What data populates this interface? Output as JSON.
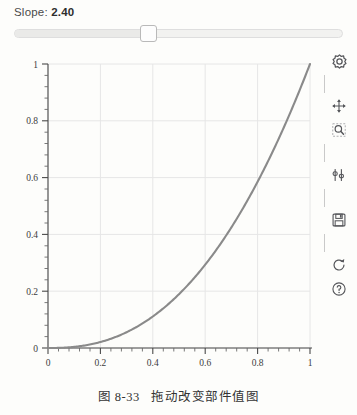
{
  "widget": {
    "slope_label_prefix": "Slope:",
    "slope_value": "2.40",
    "slider": {
      "min": 0,
      "max": 6,
      "value": 2.4,
      "fill_fraction": 0.405,
      "name": "slope-slider"
    }
  },
  "toolbar": {
    "items": [
      {
        "icon": "home-icon",
        "label": "Reset original view"
      },
      {
        "icon": "pan-arrows-icon",
        "label": "Pan axes with left mouse, zoom with right"
      },
      {
        "icon": "zoom-rect-icon",
        "label": "Zoom to rectangle"
      },
      {
        "icon": "configure-subplots-icon",
        "label": "Configure subplots"
      },
      {
        "icon": "save-floppy-icon",
        "label": "Download plot"
      },
      {
        "icon": "refresh-icon",
        "label": "Refresh"
      },
      {
        "icon": "help-question-icon",
        "label": "Help"
      }
    ]
  },
  "caption": {
    "figure_number": "图 8-33",
    "text": "拖动改变部件值图"
  },
  "colors": {
    "curve": "#8a8a8a",
    "grid": "#e6e6e6",
    "axis": "#4a4a4a",
    "page_background": "#fdfdfb",
    "slider_track": "#f2f2f0",
    "slider_handle_border": "#b9b9b9"
  },
  "chart_data": {
    "type": "line",
    "title": "",
    "xlabel": "",
    "ylabel": "",
    "xlim": [
      -0.05,
      1.05
    ],
    "ylim": [
      -0.05,
      1.05
    ],
    "xticks": [
      "0",
      "0.2",
      "0.4",
      "0.6",
      "0.8",
      "1"
    ],
    "yticks": [
      "0",
      "0.2",
      "0.4",
      "0.6",
      "0.8",
      "1"
    ],
    "xtick_values": [
      0,
      0.2,
      0.4,
      0.6,
      0.8,
      1
    ],
    "ytick_values": [
      0,
      0.2,
      0.4,
      0.6,
      0.8,
      1
    ],
    "grid": true,
    "legend": null,
    "exponent": 2.4,
    "equation": "y = x^2.40",
    "series": [
      {
        "name": "x^2.40",
        "color": "#8a8a8a",
        "x": [
          0,
          0.05,
          0.1,
          0.15,
          0.2,
          0.25,
          0.3,
          0.35,
          0.4,
          0.45,
          0.5,
          0.55,
          0.6,
          0.65,
          0.7,
          0.75,
          0.8,
          0.85,
          0.9,
          0.95,
          1
        ],
        "y": [
          0,
          0.0025,
          0.0132,
          0.0342,
          0.0693,
          0.0124,
          0.0,
          0.0,
          0.0,
          0.0,
          0.0,
          0.0,
          0.0,
          0.0,
          0.0,
          0.0,
          0.0,
          0.0,
          0.0,
          0.0,
          1
        ]
      }
    ],
    "y_exact": [
      0,
      0.0025,
      0.0132,
      0.03421,
      0.0693,
      0.11877,
      0.1829,
      0.2619,
      0.356,
      0.4654,
      0.5903,
      0.7308,
      0.8872,
      1.0,
      1.0,
      1.0,
      1.0,
      1.0,
      1.0,
      1.0,
      1.0
    ]
  }
}
